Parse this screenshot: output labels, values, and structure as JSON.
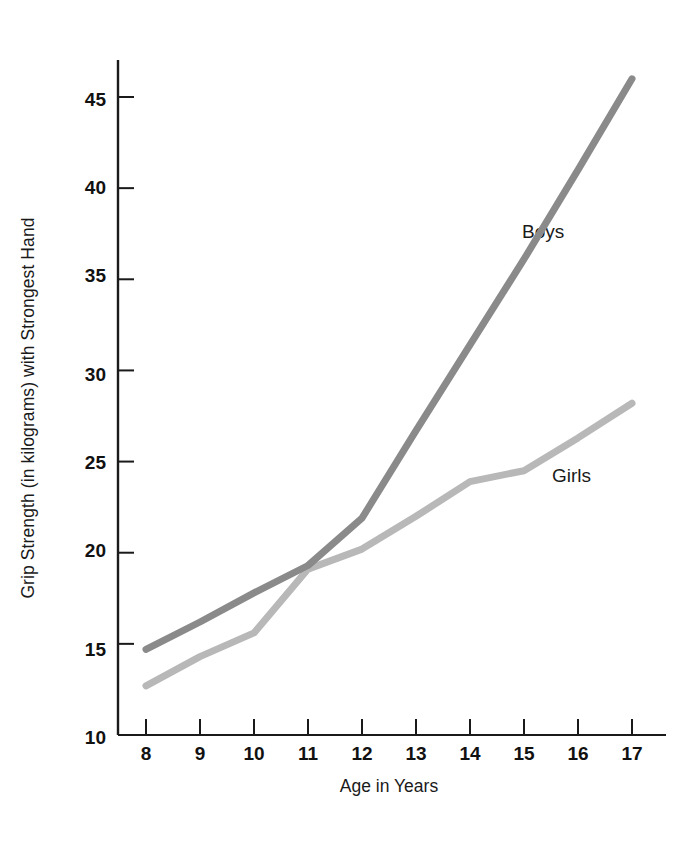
{
  "chart_data": {
    "type": "line",
    "title": "",
    "xlabel": "Age in Years",
    "ylabel": "Grip Strength (in kilograms) with Strongest Hand",
    "x": [
      8,
      9,
      10,
      11,
      12,
      13,
      14,
      15,
      16,
      17
    ],
    "xtick_labels": [
      "8",
      "9",
      "10",
      "11",
      "12",
      "13",
      "14",
      "15",
      "16",
      "17"
    ],
    "ytick_labels": [
      "10",
      "15",
      "20",
      "25",
      "30",
      "35",
      "40",
      "45"
    ],
    "ytick_values": [
      10,
      15,
      20,
      25,
      30,
      35,
      40,
      45
    ],
    "xlim": [
      8,
      17
    ],
    "ylim": [
      10,
      46.5
    ],
    "grid": false,
    "legend_position": "inline-annotations",
    "series": [
      {
        "name": "Boys",
        "color": "#8a8a8a",
        "values": [
          14.7,
          16.2,
          17.8,
          19.3,
          21.9,
          26.7,
          31.4,
          36.1,
          41.0,
          46.0
        ],
        "label_text": "Boys"
      },
      {
        "name": "Girls",
        "color": "#b8b8b8",
        "values": [
          12.7,
          14.3,
          15.6,
          19.1,
          20.2,
          22.0,
          23.9,
          24.5,
          26.3,
          28.2
        ],
        "label_text": "Girls"
      }
    ],
    "annotations": [
      {
        "text": "Boys",
        "x": 14.6,
        "y": 36.5
      },
      {
        "text": "Girls",
        "x": 15.1,
        "y": 25.2
      }
    ]
  },
  "axes": {
    "x_axis_name": "x-axis",
    "y_axis_name": "y-axis"
  }
}
